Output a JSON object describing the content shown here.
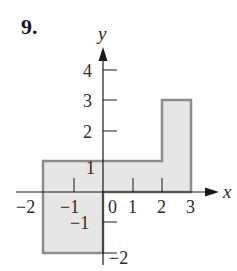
{
  "problem": {
    "number_label": "9."
  },
  "axes": {
    "x_label": "x",
    "y_label": "y",
    "x_ticks": [
      {
        "value": -2,
        "label": "−2"
      },
      {
        "value": -1,
        "label": "−1"
      },
      {
        "value": 0,
        "label": "0"
      },
      {
        "value": 1,
        "label": "1"
      },
      {
        "value": 2,
        "label": "2"
      },
      {
        "value": 3,
        "label": "3"
      }
    ],
    "y_ticks": [
      {
        "value": 4,
        "label": "4"
      },
      {
        "value": 3,
        "label": "3"
      },
      {
        "value": 2,
        "label": "2"
      },
      {
        "value": 1,
        "label": "1"
      },
      {
        "value": -1,
        "label": "−1"
      },
      {
        "value": -2,
        "label": "−2"
      }
    ],
    "x_range": [
      -2.4,
      3.9
    ],
    "y_range": [
      -2.4,
      4.8
    ]
  },
  "region": {
    "description": "Shaded region bounded by polygon",
    "vertices": [
      [
        -2,
        1
      ],
      [
        2,
        1
      ],
      [
        2,
        3
      ],
      [
        3,
        3
      ],
      [
        3,
        0
      ],
      [
        0,
        0
      ],
      [
        0,
        -2
      ],
      [
        -2,
        -2
      ]
    ],
    "fill_color": "#e6e6e6",
    "stroke_color": "#8c8c8c"
  },
  "colors": {
    "axis": "#1a1a1a",
    "text": "#2a2a2a"
  }
}
